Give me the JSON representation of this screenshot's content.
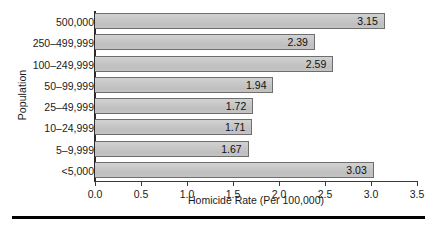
{
  "chart_data": {
    "type": "bar",
    "orientation": "horizontal",
    "title": "",
    "xlabel": "Homicide Rate (Per 100,000)",
    "ylabel": "Population",
    "categories": [
      "500,000",
      "250–499,999",
      "100–249,999",
      "50–99,999",
      "25–49,999",
      "10–24,999",
      "5–9,999",
      "<5,000"
    ],
    "values": [
      3.15,
      2.39,
      2.59,
      1.94,
      1.72,
      1.71,
      1.67,
      3.03
    ],
    "value_labels": [
      "3.15",
      "2.39",
      "2.59",
      "1.94",
      "1.72",
      "1.71",
      "1.67",
      "3.03"
    ],
    "xlim": [
      0.0,
      3.5
    ],
    "xticks": [
      0.0,
      0.5,
      1.0,
      1.5,
      2.0,
      2.5,
      3.0,
      3.5
    ],
    "xtick_labels": [
      "0.0",
      "0.5",
      "1.0",
      "1.5",
      "2.0",
      "2.5",
      "3.0",
      "3.5"
    ],
    "grid": false,
    "legend": null,
    "bar_fill_color": "#c6c6c6",
    "bar_border_color": "#6e6e6e",
    "text_color": "#1b1b1b",
    "rule_color": "#000000"
  }
}
